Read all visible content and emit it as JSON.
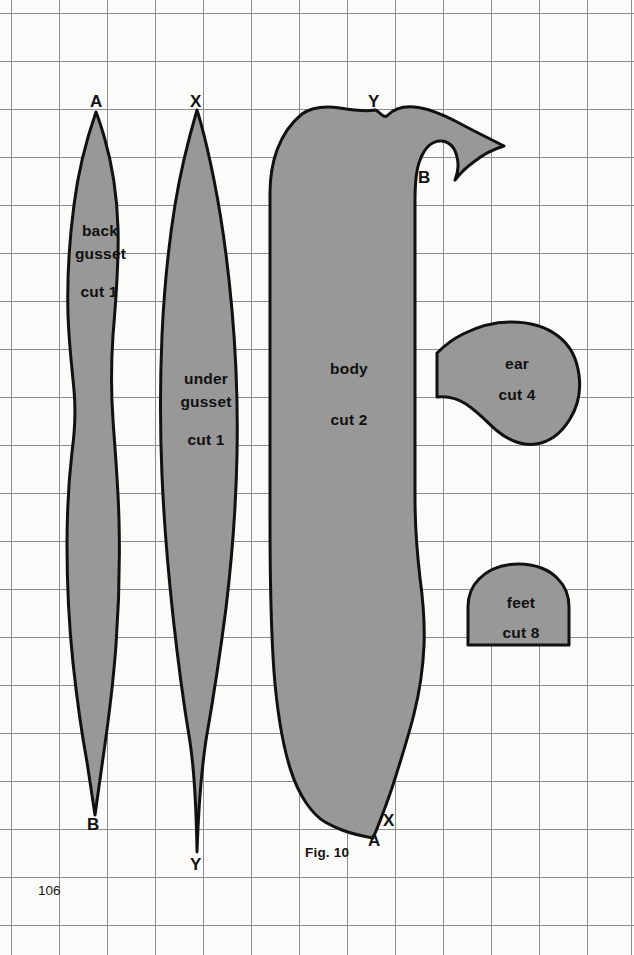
{
  "page": {
    "number": "106",
    "background_color": "#fbfbf9",
    "grid_color": "#8d8d8d",
    "grid_spacing_px": 48,
    "piece_fill_color": "#989898",
    "piece_outline_color": "#111111",
    "width": 634,
    "height": 955
  },
  "figure": {
    "caption": "Fig. 10",
    "caption_x": 305,
    "caption_y": 845
  },
  "pieces": [
    {
      "id": "back-gusset",
      "name_line1": "back",
      "name_line2": "gusset",
      "cut_label": "cut 1",
      "label_x": 98,
      "label_y": 228,
      "endpoint_top": {
        "letter": "A",
        "x": 96,
        "y": 95
      },
      "endpoint_bottom": {
        "letter": "B",
        "x": 93,
        "y": 822
      }
    },
    {
      "id": "under-gusset",
      "name_line1": "under",
      "name_line2": "gusset",
      "cut_label": "cut 1",
      "label_x": 205,
      "label_y": 376,
      "endpoint_top": {
        "letter": "X",
        "x": 197,
        "y": 95
      },
      "endpoint_bottom": {
        "letter": "Y",
        "x": 196,
        "y": 862
      }
    },
    {
      "id": "body",
      "name_line1": "body",
      "name_line2": "",
      "cut_label": "cut 2",
      "label_x": 348,
      "label_y": 365,
      "endpoint_top": {
        "letter": "Y",
        "x": 375,
        "y": 100
      },
      "endpoint_right": {
        "letter": "B",
        "x": 424,
        "y": 176
      },
      "endpoint_bottom_x": {
        "letter": "X",
        "x": 389,
        "y": 818
      },
      "endpoint_bottom_a": {
        "letter": "A",
        "x": 374,
        "y": 838
      }
    },
    {
      "id": "ear",
      "name_line1": "ear",
      "name_line2": "",
      "cut_label": "cut 4",
      "label_x": 517,
      "label_y": 360
    },
    {
      "id": "feet",
      "name_line1": "feet",
      "name_line2": "",
      "cut_label": "cut 8",
      "label_x": 521,
      "label_y": 600
    }
  ],
  "endpoint_letters": [
    "A",
    "X",
    "Y",
    "B",
    "X",
    "A",
    "B",
    "Y"
  ]
}
